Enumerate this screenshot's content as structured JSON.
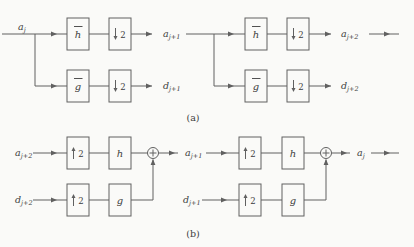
{
  "colors": {
    "background": "#fafaf8",
    "line": "#606060",
    "text": "#3d3d3d"
  },
  "captions": {
    "a": "(a)",
    "b": "(b)"
  },
  "analysis": {
    "filters_have_overbar": true,
    "input": {
      "base": "a",
      "sub": "j"
    },
    "stage1": {
      "lowpass": "h",
      "highpass": "g",
      "factor": "2",
      "out_a": {
        "base": "a",
        "sub": "j+1"
      },
      "out_d": {
        "base": "d",
        "sub": "j+1"
      }
    },
    "stage2": {
      "lowpass": "h",
      "highpass": "g",
      "factor": "2",
      "out_a": {
        "base": "a",
        "sub": "j+2"
      },
      "out_d": {
        "base": "d",
        "sub": "j+2"
      }
    }
  },
  "synthesis": {
    "stage1": {
      "in_a": {
        "base": "a",
        "sub": "j+2"
      },
      "in_d": {
        "base": "d",
        "sub": "j+2"
      },
      "factor": "2",
      "lowpass": "h",
      "highpass": "g",
      "out": {
        "base": "a",
        "sub": "j+1"
      }
    },
    "stage2": {
      "in_d": {
        "base": "d",
        "sub": "j+1"
      },
      "factor": "2",
      "lowpass": "h",
      "highpass": "g",
      "out": {
        "base": "a",
        "sub": "j"
      }
    }
  }
}
